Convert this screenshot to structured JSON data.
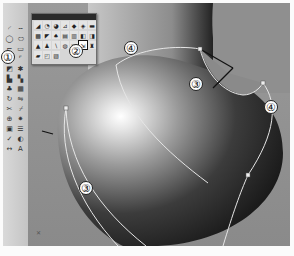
{
  "side_toolbar": {
    "buttons": [
      {
        "icon": "arc-icon",
        "glyph": "◜"
      },
      {
        "icon": "line-icon",
        "glyph": "╌"
      },
      {
        "icon": "circle-icon",
        "glyph": "◯"
      },
      {
        "icon": "ellipse-icon",
        "glyph": "⬭"
      },
      {
        "icon": "polyline-icon",
        "glyph": "⌐"
      },
      {
        "icon": "rectangle-icon",
        "glyph": "▭"
      },
      {
        "icon": "curve-icon",
        "glyph": "∽"
      },
      {
        "icon": "fillet-icon",
        "glyph": "⌜"
      },
      {
        "icon": "surface-tools-icon",
        "glyph": "◩"
      },
      {
        "icon": "point-icon",
        "glyph": "✱"
      },
      {
        "icon": "extrude-icon",
        "glyph": "▙"
      },
      {
        "icon": "loft-icon",
        "glyph": "▚"
      },
      {
        "icon": "solid-icon",
        "glyph": "♣"
      },
      {
        "icon": "mesh-icon",
        "glyph": "▦"
      },
      {
        "icon": "transform-icon",
        "glyph": "↻"
      },
      {
        "icon": "mirror-icon",
        "glyph": "⇋"
      },
      {
        "icon": "trim-icon",
        "glyph": "✂"
      },
      {
        "icon": "split-icon",
        "glyph": "⌿"
      },
      {
        "icon": "join-icon",
        "glyph": "⊕"
      },
      {
        "icon": "explode-icon",
        "glyph": "✷"
      },
      {
        "icon": "group-icon",
        "glyph": "▣"
      },
      {
        "icon": "layer-icon",
        "glyph": "☰"
      },
      {
        "icon": "analyze-icon",
        "glyph": "✓"
      },
      {
        "icon": "render-icon",
        "glyph": "◐"
      },
      {
        "icon": "dimension-icon",
        "glyph": "↔"
      },
      {
        "icon": "text-icon",
        "glyph": "A"
      }
    ]
  },
  "palette": {
    "buttons": [
      {
        "icon": "sweep-icon",
        "glyph": "◢"
      },
      {
        "icon": "revolve-icon",
        "glyph": "◔"
      },
      {
        "icon": "rail-revolve-icon",
        "glyph": "◕"
      },
      {
        "icon": "edge-surface-icon",
        "glyph": "⊿"
      },
      {
        "icon": "patch-icon",
        "glyph": "◆"
      },
      {
        "icon": "loft-surface-icon",
        "glyph": "◈"
      },
      {
        "icon": "plane-icon",
        "glyph": "▬"
      },
      {
        "icon": "network-surface-icon",
        "glyph": "▩"
      },
      {
        "icon": "sweep2-icon",
        "glyph": "◤"
      },
      {
        "icon": "blend-surface-icon",
        "glyph": "♠"
      },
      {
        "icon": "offset-surface-icon",
        "glyph": "▤"
      },
      {
        "icon": "extend-surface-icon",
        "glyph": "▥"
      },
      {
        "icon": "fillet-surface-icon",
        "glyph": "◧"
      },
      {
        "icon": "corner-icon",
        "glyph": "◨"
      },
      {
        "icon": "cone-icon",
        "glyph": "▲"
      },
      {
        "icon": "drape-icon",
        "glyph": "♟"
      },
      {
        "icon": "pipe-icon",
        "glyph": "∖"
      },
      {
        "icon": "heightfield-icon",
        "glyph": "◍"
      },
      {
        "icon": "match-surface-icon",
        "glyph": "◪"
      },
      {
        "icon": "network-srf-active-icon",
        "glyph": "⇲",
        "active": true
      },
      {
        "icon": "unroll-icon",
        "glyph": "♜"
      },
      {
        "icon": "flatten-icon",
        "glyph": "▰"
      },
      {
        "icon": "shrink-icon",
        "glyph": "◰"
      },
      {
        "icon": "rebuild-icon",
        "glyph": "▨"
      }
    ]
  },
  "callouts": [
    {
      "label": "①",
      "x": 8,
      "y": 57
    },
    {
      "label": "②",
      "x": 76,
      "y": 51
    },
    {
      "label": "④",
      "x": 131,
      "y": 48
    },
    {
      "label": "③",
      "x": 196,
      "y": 84
    },
    {
      "label": "④",
      "x": 271,
      "y": 107
    },
    {
      "label": "③",
      "x": 86,
      "y": 188
    }
  ],
  "colors": {
    "viewport_bg": "#8d8d8d",
    "curve": "#e8e8e8",
    "object_dark": "#1e1e1e",
    "highlight": "#ffffff"
  }
}
